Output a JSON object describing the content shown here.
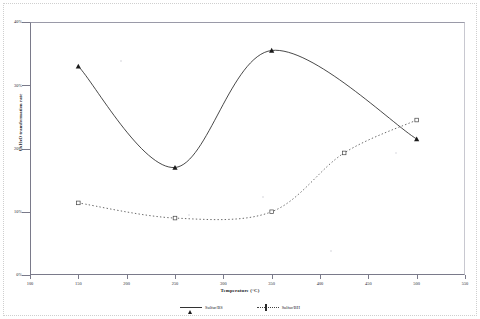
{
  "chart_data": {
    "type": "line",
    "title": "",
    "xlabel": "Temperature (°C)",
    "ylabel": "CxHxO transformation rate",
    "xlim": [
      100,
      550
    ],
    "ylim": [
      0,
      40
    ],
    "xticks": [
      100,
      150,
      200,
      250,
      300,
      350,
      400,
      450,
      500,
      550
    ],
    "xtick_labels": [
      "100",
      "150",
      "200",
      "250",
      "300",
      "350",
      "400",
      "450",
      "500",
      "550"
    ],
    "yticks": [
      0,
      10,
      20,
      30,
      40
    ],
    "ytick_labels": [
      "0%",
      "10%",
      "20%",
      "30%",
      "40%"
    ],
    "grid": false,
    "legend_position": "bottom",
    "series": [
      {
        "name": "Sulfur/BS",
        "marker": "triangle-filled",
        "line": "solid",
        "color": "#1a1a1a",
        "x": [
          150,
          250,
          350,
          500
        ],
        "y": [
          33.0,
          17.0,
          35.5,
          21.5
        ]
      },
      {
        "name": "Sulfur/BH",
        "marker": "square-open",
        "line": "dotted",
        "color": "#444444",
        "x": [
          150,
          250,
          350,
          425,
          500
        ],
        "y": [
          11.4,
          9.0,
          10.0,
          19.3,
          24.5
        ]
      }
    ]
  }
}
